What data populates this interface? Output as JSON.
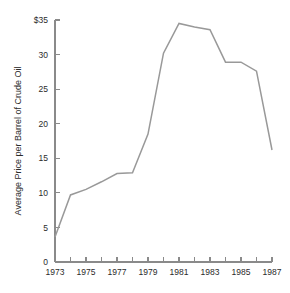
{
  "chart_data": {
    "type": "line",
    "title": "",
    "xlabel": "",
    "ylabel": "Average Price per Barrel of Crude Oil",
    "x": [
      1973,
      1974,
      1975,
      1976,
      1977,
      1978,
      1979,
      1980,
      1981,
      1982,
      1983,
      1984,
      1985,
      1986,
      1987
    ],
    "values": [
      3.6,
      9.7,
      10.5,
      11.6,
      12.8,
      12.9,
      18.5,
      30.2,
      34.5,
      34.0,
      33.6,
      28.9,
      28.9,
      27.6,
      16.2
    ],
    "xlim": [
      1973,
      1987
    ],
    "ylim": [
      0,
      35
    ],
    "grid": false,
    "legend": null,
    "line_color": "#999999",
    "axis_color": "#8a8a8a",
    "background_color": "#ffffff",
    "y_ticks": [
      0,
      5,
      10,
      15,
      20,
      25,
      30,
      35
    ],
    "y_tick_labels": [
      "0",
      "5",
      "10",
      "15",
      "20",
      "25",
      "30",
      "$35"
    ],
    "x_ticks": [
      1973,
      1974,
      1975,
      1976,
      1977,
      1978,
      1979,
      1980,
      1981,
      1982,
      1983,
      1984,
      1985,
      1986,
      1987
    ],
    "x_tick_labels": [
      "1973",
      "",
      "1975",
      "",
      "1977",
      "",
      "1979",
      "",
      "1981",
      "",
      "1983",
      "",
      "1985",
      "",
      "1987"
    ]
  }
}
